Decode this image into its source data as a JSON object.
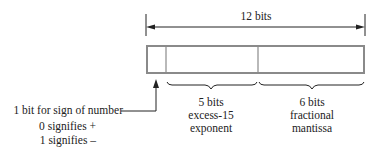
{
  "diagram": {
    "total_label": "12 bits",
    "sign_label": "1 bit for sign of number",
    "sign_zero": "0 signifies +",
    "sign_one": "1 signifies –",
    "exponent": {
      "line1": "5 bits",
      "line2": "excess-15",
      "line3": "exponent"
    },
    "mantissa": {
      "line1": "6 bits",
      "line2": "fractional",
      "line3": "mantissa"
    },
    "colors": {
      "box": "#8a8a8a",
      "line": "#222222"
    }
  }
}
